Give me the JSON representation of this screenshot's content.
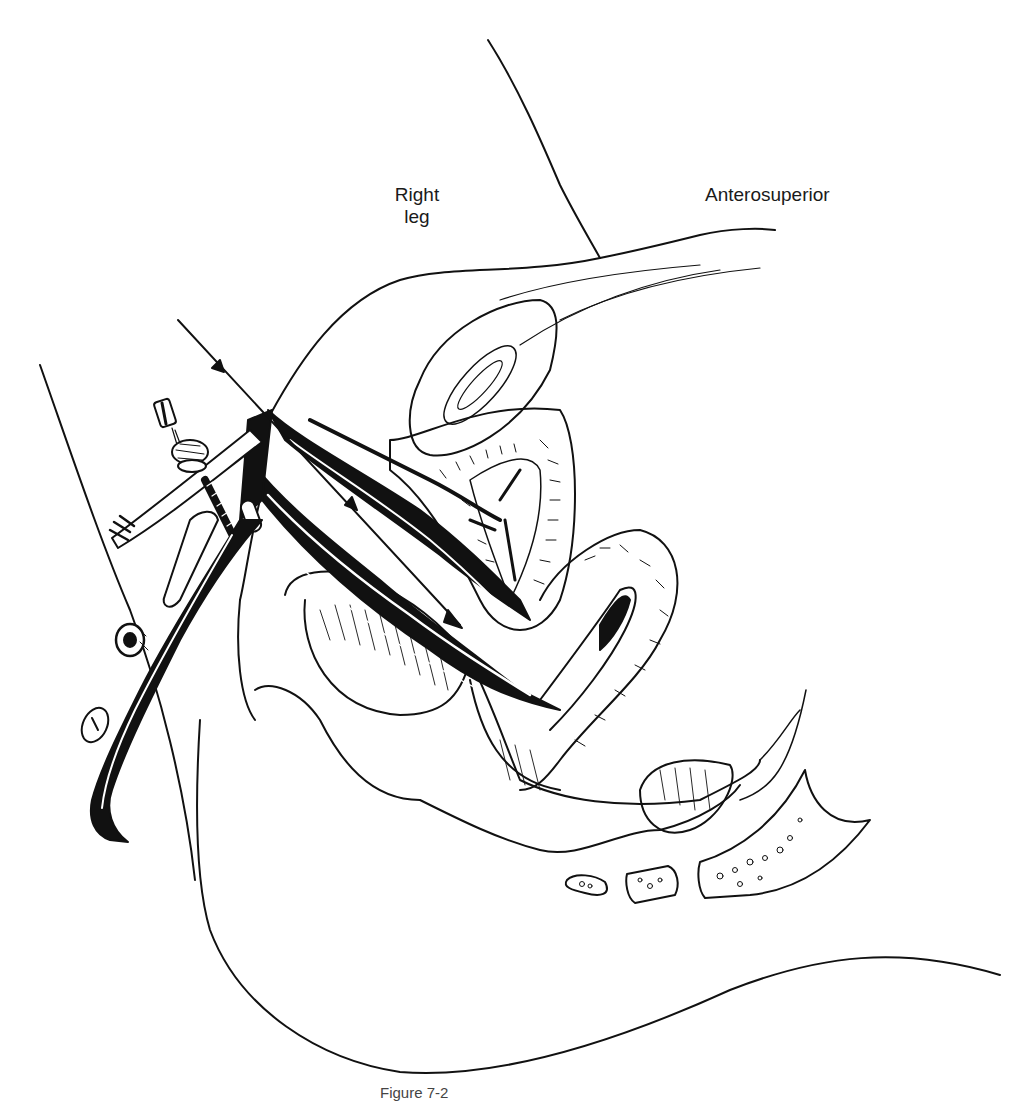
{
  "figure": {
    "type": "medical line illustration",
    "labels": {
      "right_leg_line1": "Right",
      "right_leg_line2": "leg",
      "anterosuperior": "Anterosuperior"
    },
    "caption": "Figure 7-2",
    "colors": {
      "ink": "#111111",
      "paper": "#ffffff",
      "label_text": "#1a1a1a"
    }
  }
}
